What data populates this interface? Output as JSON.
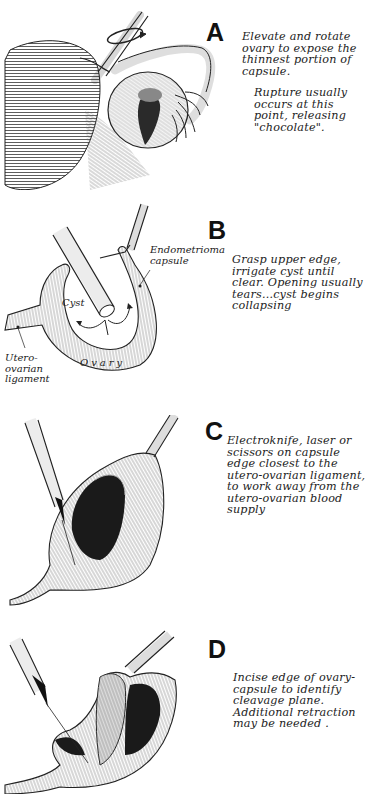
{
  "figure": {
    "panels": [
      {
        "id": "A",
        "letter": "A",
        "caption": "Elevate and rotate\novary to expose the\nthinnest portion of\ncapsule.",
        "note": "Rupture usually\noccurs at this\npoint, releasing\n\"chocolate\"."
      },
      {
        "id": "B",
        "letter": "B",
        "caption": "Grasp upper edge,\nirrigate cyst until\nclear. Opening usually\ntears...cyst  begins\ncollapsing",
        "labels": {
          "capsule": "Endometrioma\ncapsule",
          "cyst": "Cyst",
          "ovary": "Ovary",
          "ligament": "Utero-\novarian\nligament"
        }
      },
      {
        "id": "C",
        "letter": "C",
        "caption": "Electroknife, laser or\nscissors on capsule\nedge closest  to the\nutero-ovarian ligament,\nto work away from the\nutero-ovarian blood\nsupply"
      },
      {
        "id": "D",
        "letter": "D",
        "caption": "Incise edge of ovary-\ncapsule  to identify\ncleavage plane.\nAdditional retraction\nmay be needed ."
      }
    ],
    "colors": {
      "ink": "#1a1a1a",
      "background": "#ffffff",
      "shade": "#555555"
    }
  }
}
